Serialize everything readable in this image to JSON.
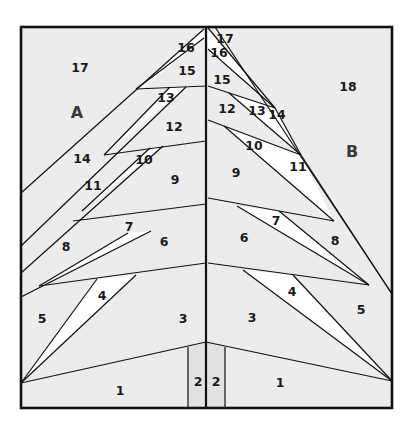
{
  "diagram": {
    "colors": {
      "background": "#ececec",
      "highlight_piece": "#ffffff",
      "trunk": "#e2e2e2",
      "line": "#111111"
    },
    "sections": [
      {
        "id": "A",
        "label": "A",
        "x": 77,
        "y": 118
      },
      {
        "id": "B",
        "label": "B",
        "x": 352,
        "y": 157
      }
    ],
    "left_pieces": [
      {
        "label": "1",
        "x": 120,
        "y": 392
      },
      {
        "label": "2",
        "x": 198,
        "y": 383
      },
      {
        "label": "3",
        "x": 183,
        "y": 320
      },
      {
        "label": "4",
        "x": 102,
        "y": 297
      },
      {
        "label": "5",
        "x": 42,
        "y": 320
      },
      {
        "label": "6",
        "x": 164,
        "y": 243
      },
      {
        "label": "7",
        "x": 129,
        "y": 228
      },
      {
        "label": "8",
        "x": 66,
        "y": 248
      },
      {
        "label": "9",
        "x": 175,
        "y": 181
      },
      {
        "label": "10",
        "x": 144,
        "y": 161
      },
      {
        "label": "11",
        "x": 93,
        "y": 187
      },
      {
        "label": "12",
        "x": 174,
        "y": 128
      },
      {
        "label": "13",
        "x": 166,
        "y": 99
      },
      {
        "label": "14",
        "x": 82,
        "y": 160
      },
      {
        "label": "15",
        "x": 187,
        "y": 72
      },
      {
        "label": "16",
        "x": 186,
        "y": 49
      },
      {
        "label": "17",
        "x": 80,
        "y": 69
      }
    ],
    "right_pieces": [
      {
        "label": "1",
        "x": 280,
        "y": 384
      },
      {
        "label": "2",
        "x": 216,
        "y": 383
      },
      {
        "label": "3",
        "x": 252,
        "y": 319
      },
      {
        "label": "4",
        "x": 292,
        "y": 293
      },
      {
        "label": "5",
        "x": 361,
        "y": 311
      },
      {
        "label": "6",
        "x": 244,
        "y": 239
      },
      {
        "label": "7",
        "x": 276,
        "y": 222
      },
      {
        "label": "8",
        "x": 335,
        "y": 242
      },
      {
        "label": "9",
        "x": 236,
        "y": 174
      },
      {
        "label": "10",
        "x": 254,
        "y": 147
      },
      {
        "label": "11",
        "x": 298,
        "y": 168
      },
      {
        "label": "12",
        "x": 227,
        "y": 110
      },
      {
        "label": "13",
        "x": 257,
        "y": 112
      },
      {
        "label": "14",
        "x": 277,
        "y": 116
      },
      {
        "label": "15",
        "x": 222,
        "y": 81
      },
      {
        "label": "16",
        "x": 219,
        "y": 54
      },
      {
        "label": "17",
        "x": 225,
        "y": 40
      }
    ]
  }
}
